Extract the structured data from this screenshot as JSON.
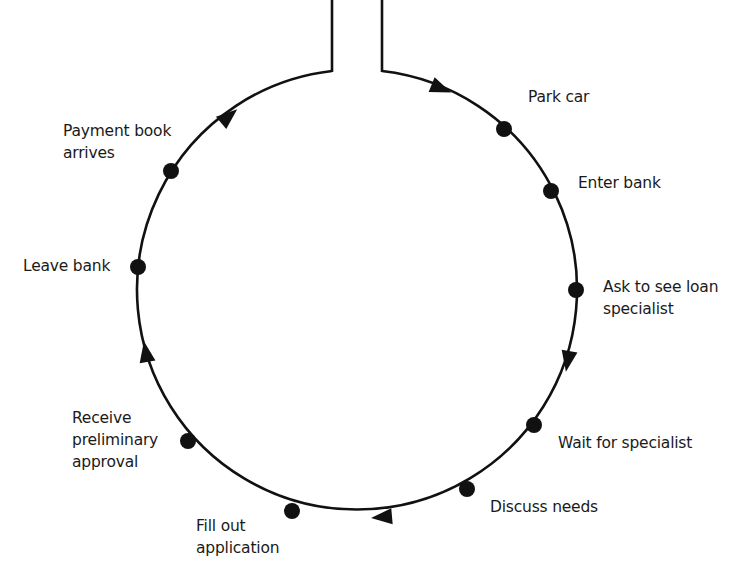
{
  "diagram": {
    "type": "cycle",
    "stroke_color": "#111111",
    "steps": [
      {
        "id": "park-car",
        "label": "Park car"
      },
      {
        "id": "enter-bank",
        "label": "Enter bank"
      },
      {
        "id": "ask-loan-specialist",
        "label": "Ask to see loan\nspecialist"
      },
      {
        "id": "wait-for-specialist",
        "label": "Wait for specialist"
      },
      {
        "id": "discuss-needs",
        "label": "Discuss needs"
      },
      {
        "id": "fill-out-application",
        "label": "Fill out\napplication"
      },
      {
        "id": "receive-preliminary-approval",
        "label": "Receive\npreliminary\napproval"
      },
      {
        "id": "leave-bank",
        "label": "Leave bank"
      },
      {
        "id": "payment-book-arrives",
        "label": "Payment book\narrives"
      }
    ],
    "direction": "clockwise"
  }
}
